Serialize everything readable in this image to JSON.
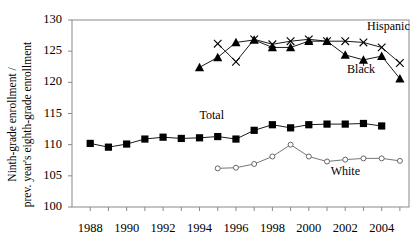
{
  "chart_data": {
    "type": "line",
    "title": "",
    "xlabel": "",
    "ylabel": "Ninth-grade enrollment / prev. year's eighth-grade enrollment",
    "ylabel_line1": "Ninth-grade enrollment /",
    "ylabel_line2": "prev. year's eighth-grade enrollment",
    "ylim": [
      100,
      130
    ],
    "yticks": [
      100,
      105,
      110,
      115,
      120,
      125,
      130
    ],
    "xlim": [
      1987,
      2005.5
    ],
    "xticks": [
      1988,
      1989,
      1990,
      1991,
      1992,
      1993,
      1994,
      1995,
      1996,
      1997,
      1998,
      1999,
      2000,
      2001,
      2002,
      2003,
      2004,
      2005
    ],
    "xticklabels": [
      "1988",
      "1990",
      "1992",
      "1994",
      "1996",
      "1998",
      "2000",
      "2002",
      "2004"
    ],
    "xticklabel_years": [
      1988,
      1990,
      1992,
      1994,
      1996,
      1998,
      2000,
      2002,
      2004
    ],
    "grid": false,
    "legend_position": "inline-annotations",
    "series": [
      {
        "name": "Total",
        "marker": "filled-square",
        "color": "#000000",
        "label": "Total",
        "x": [
          1988,
          1989,
          1990,
          1991,
          1992,
          1993,
          1994,
          1995,
          1996,
          1997,
          1998,
          1999,
          2000,
          2001,
          2002,
          2003,
          2004
        ],
        "y": [
          110.2,
          109.6,
          110.1,
          110.9,
          111.2,
          111.0,
          111.1,
          111.3,
          110.9,
          112.3,
          113.2,
          112.7,
          113.2,
          113.3,
          113.3,
          113.4,
          113.0
        ]
      },
      {
        "name": "Black",
        "marker": "filled-triangle",
        "color": "#000000",
        "label": "Black",
        "x": [
          1994,
          1995,
          1996,
          1997,
          1998,
          1999,
          2000,
          2001,
          2002,
          2003,
          2004,
          2005
        ],
        "y": [
          122.4,
          124.0,
          126.4,
          126.8,
          125.6,
          125.6,
          126.6,
          126.6,
          124.4,
          123.6,
          124.2,
          120.6
        ]
      },
      {
        "name": "Hispanic",
        "marker": "cross-x",
        "color": "#000000",
        "label": "Hispanic",
        "x": [
          1995,
          1996,
          1997,
          1998,
          1999,
          2000,
          2001,
          2002,
          2003,
          2004,
          2005
        ],
        "y": [
          126.2,
          123.3,
          126.9,
          126.1,
          126.6,
          126.9,
          126.6,
          126.6,
          126.4,
          125.6,
          123.1
        ]
      },
      {
        "name": "White",
        "marker": "open-circle",
        "color": "#666666",
        "label": "White",
        "x": [
          1995,
          1996,
          1997,
          1998,
          1999,
          2000,
          2001,
          2002,
          2003,
          2004,
          2005
        ],
        "y": [
          106.2,
          106.3,
          106.9,
          108.1,
          110.0,
          108.1,
          107.3,
          107.6,
          107.8,
          107.8,
          107.4
        ]
      }
    ],
    "annotations": [
      {
        "text": "Hispanic",
        "x": 2003.2,
        "y": 128.9
      },
      {
        "text": "Black",
        "x": 2002.1,
        "y": 121.9
      },
      {
        "text": "Total",
        "x": 1994.0,
        "y": 114.6
      },
      {
        "text": "White",
        "x": 2001.2,
        "y": 105.6
      }
    ]
  }
}
